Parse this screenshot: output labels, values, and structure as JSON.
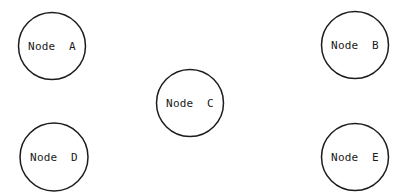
{
  "canvas": {
    "width": 403,
    "height": 195,
    "background_color": "#ffffff"
  },
  "diagram": {
    "type": "node-graph",
    "stroke_color": "#1c1c1c",
    "stroke_width": 1.5,
    "label_color": "#1a1a1a",
    "label_font_size": 11,
    "edges": [],
    "nodes": [
      {
        "id": "A",
        "label": "Node  A",
        "cx": 52,
        "cy": 46,
        "r": 33.5
      },
      {
        "id": "B",
        "label": "Node  B",
        "cx": 355,
        "cy": 45,
        "r": 33.5
      },
      {
        "id": "C",
        "label": "Node  C",
        "cx": 190,
        "cy": 103,
        "r": 33.5
      },
      {
        "id": "D",
        "label": "Node  D",
        "cx": 54,
        "cy": 157,
        "r": 34
      },
      {
        "id": "E",
        "label": "Node  E",
        "cx": 355,
        "cy": 157,
        "r": 33.5
      }
    ]
  }
}
